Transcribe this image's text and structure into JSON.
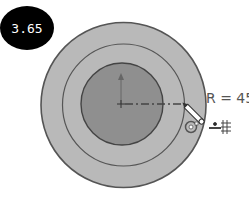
{
  "badge": {
    "value": "3.65"
  },
  "dimension": {
    "label": "R = 45"
  },
  "colors": {
    "outer_fill": "#b9b9b9",
    "inner_fill": "#8f8f8f",
    "stroke": "#555555",
    "badge_bg": "#000000"
  },
  "shapes": {
    "outer_circle": {
      "cx": 123.5,
      "cy": 105,
      "r": 82.5
    },
    "middle_ring": {
      "cx": 123.5,
      "cy": 105,
      "r": 61
    },
    "inner_circle": {
      "cx": 122,
      "cy": 104,
      "r": 41
    }
  },
  "icons": [
    "pencil-cursor-icon",
    "circle-constraint-icon",
    "grid-snap-icon"
  ]
}
